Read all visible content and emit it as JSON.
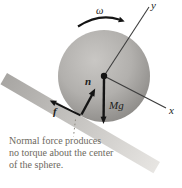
{
  "figure": {
    "caption": {
      "line1": "Normal force produces",
      "line2": "no torque about the center",
      "line3": "of the sphere."
    },
    "labels": {
      "omega": "ω",
      "y_axis": "y",
      "x_axis": "x",
      "normal_force": "n",
      "weight": "Mg",
      "friction": "f"
    },
    "colors": {
      "background": "#ffffff",
      "sphere_highlight": "#c9c7c4",
      "sphere_mid": "#b2b0ad",
      "sphere_edge": "#8e8c89",
      "sphere_rim": "#7e7c79",
      "incline_dark": "#a8a6a3",
      "incline_light": "#e7e5e2",
      "arrow": "#141414",
      "axis": "#3d3d3d",
      "caption_text": "#6d6960",
      "leader_line": "#8d897f"
    }
  }
}
